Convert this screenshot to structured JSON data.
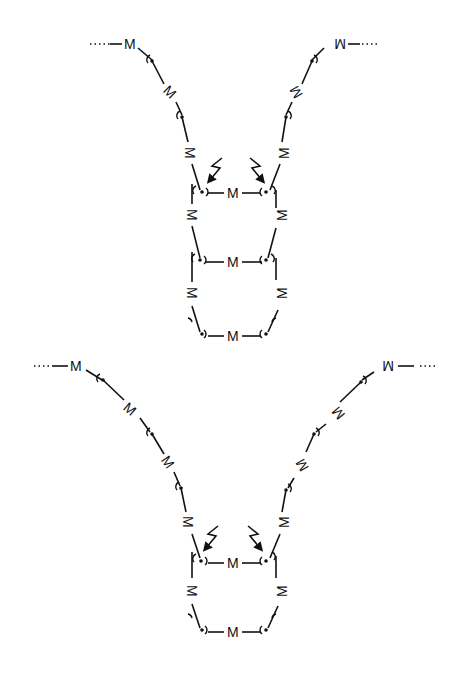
{
  "diagram": {
    "unit_label": "M",
    "structures": [
      {
        "id": "top",
        "description": "Two polymer chains of M units converging into a ladder of three M rungs with two photo-excitation arrows",
        "left_chain": [
          "M",
          "M",
          "M",
          "M"
        ],
        "right_chain": [
          "M",
          "M",
          "M",
          "M"
        ],
        "rungs": [
          "M",
          "M",
          "M"
        ],
        "ladder_sides_left": [
          "M",
          "M"
        ],
        "ladder_sides_right": [
          "M",
          "M"
        ],
        "excitation_arrows": 2
      },
      {
        "id": "bottom",
        "description": "Two longer polymer chains of M units converging into a ladder of two M rungs with two photo-excitation arrows",
        "left_chain": [
          "M",
          "M",
          "M",
          "M",
          "M"
        ],
        "right_chain": [
          "M",
          "M",
          "M",
          "M",
          "M"
        ],
        "rungs": [
          "M",
          "M"
        ],
        "ladder_sides_left": [
          "M"
        ],
        "ladder_sides_right": [
          "M"
        ],
        "excitation_arrows": 2
      }
    ],
    "colors": {
      "line": "#111111",
      "background": "#ffffff"
    }
  }
}
